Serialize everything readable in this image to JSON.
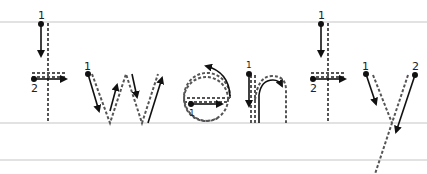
{
  "worksheet": {
    "word": "twenty",
    "letters": [
      "t",
      "w",
      "e",
      "n",
      "t",
      "y"
    ],
    "guide_lines": {
      "top_y": 22,
      "baseline_y": 123,
      "descender_y": 160,
      "color": "#e2e2e2"
    },
    "stroke_color": "#555555",
    "arrow_color": "#111111",
    "stroke_numbers": {
      "t1": [
        "1",
        "2"
      ],
      "w": [
        "1"
      ],
      "e": [
        "1"
      ],
      "n": [
        "1"
      ],
      "t2": [
        "1",
        "2"
      ],
      "y": [
        "1",
        "2"
      ]
    }
  }
}
